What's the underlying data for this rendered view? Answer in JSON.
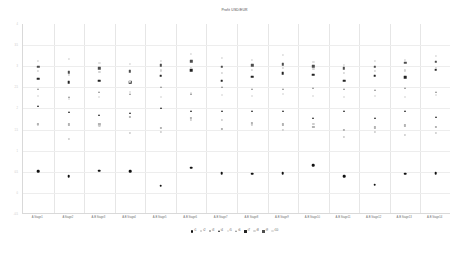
{
  "chart_data": {
    "type": "scatter",
    "title": "Profit USD/EUR",
    "xlabel": "",
    "ylabel": "",
    "grid": true,
    "legend_position": "bottom",
    "ylim": [
      -0.5,
      4.0
    ],
    "yticks": [
      "4",
      "3.5",
      "3",
      "2.5",
      "2",
      "1.5",
      "1",
      "0.5",
      "0",
      "-0.5"
    ],
    "ytick_values": [
      4.0,
      3.5,
      3.0,
      2.5,
      2.0,
      1.5,
      1.0,
      0.5,
      0.0,
      -0.5
    ],
    "categories": [
      "A Stage1",
      "A Stage2",
      "A-B Stage3",
      "A-B Stage4",
      "A-B Stage5",
      "A-B Stage6",
      "A-B Stage7",
      "A-B Stage8",
      "A-B Stage9",
      "A-B Stage10",
      "A-B Stage11",
      "A-B Stage12",
      "A-B Stage13",
      "A-B Stage14"
    ],
    "series": [
      {
        "name": "t1",
        "marker": "circle",
        "color": "#111111",
        "size": 2.6,
        "values": [
          0.52,
          0.4,
          0.53,
          0.52,
          0.17,
          0.6,
          0.47,
          0.45,
          0.46,
          0.65,
          0.4,
          0.19,
          0.45,
          0.47
        ]
      },
      {
        "name": "t2",
        "marker": "circle",
        "color": "#cccccc",
        "size": 2.2,
        "values": [
          1.62,
          1.28,
          1.6,
          1.42,
          1.45,
          1.72,
          1.72,
          1.62,
          1.5,
          1.63,
          1.33,
          1.45,
          1.37,
          1.42
        ]
      },
      {
        "name": "t3",
        "marker": "square",
        "color": "#b3b3b3",
        "size": 2.2,
        "values": [
          1.64,
          1.62,
          1.63,
          1.8,
          1.53,
          1.78,
          1.52,
          1.65,
          1.62,
          1.57,
          1.5,
          1.55,
          1.6,
          1.56
        ]
      },
      {
        "name": "t4",
        "marker": "triangle",
        "color": "#1f1f1f",
        "size": 2.5,
        "values": [
          2.06,
          1.92,
          1.85,
          1.9,
          2.0,
          1.93,
          1.93,
          1.95,
          1.93,
          1.78,
          1.93,
          1.78,
          1.93,
          1.8
        ]
      },
      {
        "name": "t5",
        "marker": "circle",
        "color": "#e0e0e0",
        "size": 2.0,
        "values": [
          2.3,
          2.22,
          2.28,
          2.4,
          2.26,
          2.37,
          2.32,
          2.3,
          2.34,
          2.3,
          2.28,
          2.3,
          2.28,
          2.33
        ]
      },
      {
        "name": "t6",
        "marker": "triangle",
        "color": "#8c8c8c",
        "size": 2.3,
        "values": [
          2.45,
          2.28,
          2.4,
          2.35,
          2.5,
          2.35,
          2.5,
          2.45,
          2.47,
          2.49,
          2.45,
          2.43,
          2.48,
          2.4
        ]
      },
      {
        "name": "t7",
        "marker": "square",
        "color": "#232323",
        "size": 2.6,
        "values": [
          2.7,
          2.62,
          2.66,
          2.62,
          2.78,
          2.9,
          2.66,
          2.75,
          2.83,
          2.8,
          2.66,
          2.78,
          2.74,
          2.92
        ]
      },
      {
        "name": "t8",
        "marker": "circle",
        "color": "#d4d4d4",
        "size": 2.1,
        "values": [
          2.88,
          2.8,
          2.86,
          2.64,
          2.9,
          2.95,
          2.84,
          2.92,
          2.95,
          2.93,
          2.85,
          2.88,
          2.9,
          2.96
        ]
      },
      {
        "name": "t9",
        "marker": "square",
        "color": "#4d4d4d",
        "size": 2.4,
        "values": [
          2.98,
          2.86,
          2.95,
          2.88,
          3.02,
          3.12,
          2.98,
          3.02,
          3.05,
          3.0,
          2.95,
          2.98,
          3.08,
          3.1
        ]
      },
      {
        "name": "t10",
        "marker": "circle",
        "color": "#dedede",
        "size": 2.2,
        "values": [
          3.12,
          3.18,
          3.08,
          3.06,
          3.12,
          3.3,
          3.2,
          3.14,
          3.26,
          3.1,
          3.04,
          3.12,
          3.14,
          3.24
        ]
      }
    ]
  },
  "legend": {
    "items": [
      {
        "label": "t1"
      },
      {
        "label": "t2"
      },
      {
        "label": "t3"
      },
      {
        "label": "t4"
      },
      {
        "label": "t5"
      },
      {
        "label": "t6"
      },
      {
        "label": "t7"
      },
      {
        "label": "t8"
      },
      {
        "label": "t9"
      },
      {
        "label": "t10"
      }
    ]
  }
}
